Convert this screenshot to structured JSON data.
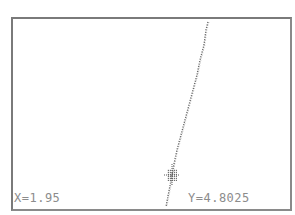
{
  "calculator": {
    "mode": "graph-trace",
    "function": "Y1=X^2+1",
    "trace": {
      "x_label": "X=1.95",
      "y_label": "Y=4.8025",
      "x": 1.95,
      "y": 4.8025
    },
    "colors": {
      "screen_bg": "#ffffff",
      "border": "#7a7a7a",
      "pixel": "#666666",
      "readout_text": "#8c8c8c"
    }
  }
}
